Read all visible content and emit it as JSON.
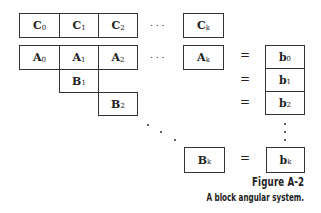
{
  "diagram": {
    "row_c": [
      {
        "sym": "C",
        "sub": "0"
      },
      {
        "sym": "C",
        "sub": "1"
      },
      {
        "sym": "C",
        "sub": "2"
      },
      {
        "sym": "C",
        "sub": "k"
      }
    ],
    "row_a": [
      {
        "sym": "A",
        "sub": "0"
      },
      {
        "sym": "A",
        "sub": "1"
      },
      {
        "sym": "A",
        "sub": "2"
      },
      {
        "sym": "A",
        "sub": "k"
      }
    ],
    "blocks_b": [
      {
        "sym": "B",
        "sub": "1"
      },
      {
        "sym": "B",
        "sub": "2"
      },
      {
        "sym": "B",
        "sub": "k"
      }
    ],
    "rhs": [
      {
        "sym": "b",
        "sub": "0"
      },
      {
        "sym": "b",
        "sub": "1"
      },
      {
        "sym": "b",
        "sub": "2"
      },
      {
        "sym": "b",
        "sub": "k"
      }
    ],
    "equals": "=",
    "ellipsis": ". . ."
  },
  "caption": {
    "title": "Figure A-2",
    "text": "A block angular system."
  }
}
